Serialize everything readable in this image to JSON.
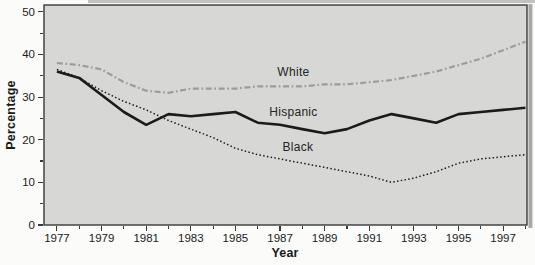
{
  "figure": {
    "y_axis_title": "Percentage",
    "x_axis_title": "Year"
  },
  "chart_data": {
    "type": "line",
    "title": "",
    "xlabel": "Year",
    "ylabel": "Percentage",
    "grid": false,
    "legend": "inline-labels",
    "plot_bg": "#d7d7d5",
    "frame_color": "#3a3a38",
    "text_color": "#1c1c1c",
    "x_axis": {
      "min": 1976.42,
      "max": 1998.07,
      "tick_start": 1977,
      "tick_end": 1998,
      "minor_tick_step": 1,
      "label_step": 2
    },
    "y_axis": {
      "min": 0,
      "max": 51.6,
      "minor_tick_step": 5,
      "major_tick_step": 10
    },
    "x_years": [
      1977,
      1978,
      1979,
      1980,
      1981,
      1982,
      1983,
      1984,
      1985,
      1986,
      1987,
      1988,
      1989,
      1990,
      1991,
      1992,
      1993,
      1994,
      1995,
      1996,
      1997,
      1998
    ],
    "x_tick_labels": [
      "1977",
      "1979",
      "1981",
      "1983",
      "1985",
      "1987",
      "1989",
      "1991",
      "1993",
      "1995",
      "1997"
    ],
    "y_tick_labels": [
      "0",
      "10",
      "20",
      "30",
      "40",
      "50"
    ],
    "series": [
      {
        "name": "White",
        "color": "#9c9c9a",
        "line_style": "dash-dot",
        "stroke_width": 2.2,
        "values": [
          38,
          37.5,
          36.5,
          33.5,
          31.5,
          31,
          32,
          32,
          32,
          32.5,
          32.5,
          32.5,
          33,
          33,
          33.5,
          34,
          35,
          36,
          37.5,
          39,
          41,
          43
        ],
        "label_at": {
          "year": 1987.6,
          "value": 35.8
        }
      },
      {
        "name": "Hispanic",
        "color": "#1b1b1b",
        "line_style": "solid",
        "stroke_width": 2.6,
        "values": [
          36,
          34.5,
          30.5,
          26.5,
          23.5,
          26,
          25.5,
          26,
          26.5,
          24,
          23.5,
          22.5,
          21.5,
          22.5,
          24.5,
          26,
          25,
          24,
          26,
          26.5,
          27,
          27.5
        ],
        "label_at": {
          "year": 1987.6,
          "value": 26.4
        }
      },
      {
        "name": "Black",
        "color": "#1b1b1b",
        "line_style": "dotted",
        "stroke_width": 1.5,
        "values": [
          36.5,
          34.5,
          31.5,
          29,
          27,
          24.5,
          22.5,
          20.5,
          18,
          16.5,
          15.5,
          14.5,
          13.5,
          12.5,
          11.5,
          10,
          11,
          12.5,
          14.5,
          15.5,
          16,
          16.5
        ],
        "label_at": {
          "year": 1987.8,
          "value": 18.3
        }
      }
    ]
  }
}
